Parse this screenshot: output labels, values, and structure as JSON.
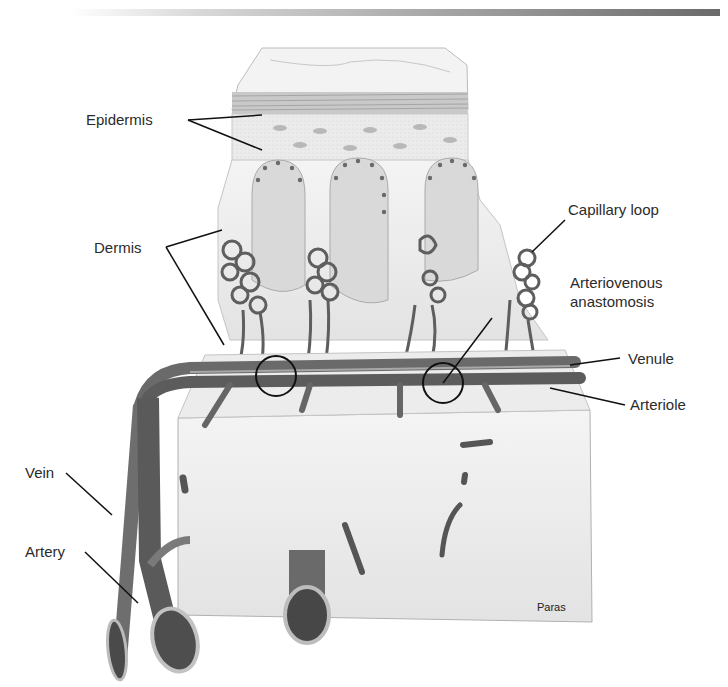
{
  "figure": {
    "labels": {
      "epidermis": "Epidermis",
      "dermis": "Dermis",
      "capillary_loop": "Capillary loop",
      "av_anastomosis_line1": "Arteriovenous",
      "av_anastomosis_line2": "anastomosis",
      "venule": "Venule",
      "arteriole": "Arteriole",
      "vein": "Vein",
      "artery": "Artery"
    },
    "credit": "Paras",
    "colors": {
      "vessel_dark": "#5a5a5a",
      "vessel_mid": "#7d7d7d",
      "tissue_light": "#ececec",
      "papilla": "#d6d6d6",
      "leader_line": "#111111"
    }
  }
}
